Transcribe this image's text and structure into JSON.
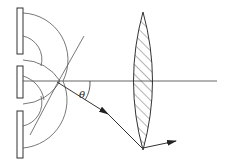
{
  "diagram": {
    "title": "",
    "labels": {
      "angle": "θ"
    },
    "elements": [
      "double-slit screen (three plates, two slits)",
      "circular wavefronts from each slit",
      "horizontal optical axis",
      "converging lens (hatched)",
      "diffracted ray at angle θ",
      "ray refracted by lens to focal point"
    ],
    "colors": {
      "line": "#333333",
      "background": "#ffffff"
    }
  }
}
